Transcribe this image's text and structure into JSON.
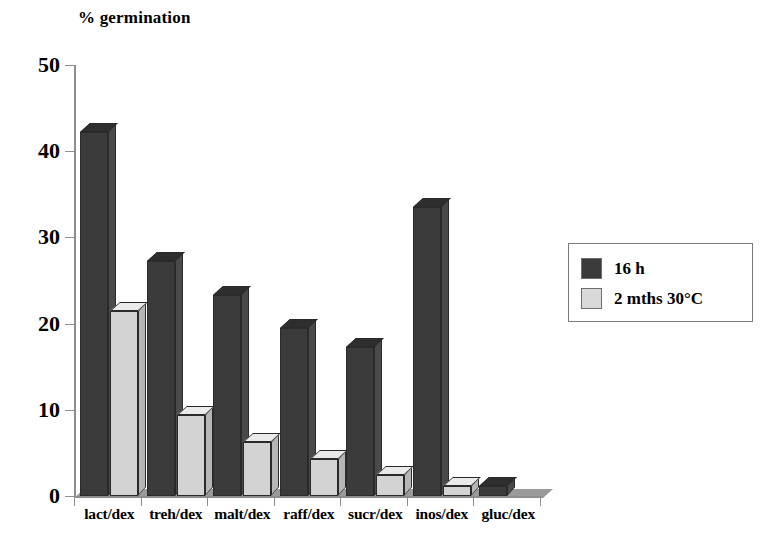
{
  "chart_data": {
    "type": "bar",
    "title": "% germination",
    "xlabel": "",
    "ylabel": "% germination",
    "ylim": [
      0,
      50
    ],
    "yticks": [
      0,
      10,
      20,
      30,
      40,
      50
    ],
    "grid": false,
    "legend_position": "right",
    "categories": [
      "lact/dex",
      "treh/dex",
      "malt/dex",
      "raff/dex",
      "sucr/dex",
      "inos/dex",
      "gluc/dex"
    ],
    "series": [
      {
        "name": "16 h",
        "color": "#3b3b3b",
        "values": [
          42.2,
          27.3,
          23.3,
          19.5,
          17.3,
          33.5,
          1.2
        ]
      },
      {
        "name": "2 mths 30°C",
        "color": "#d3d3d3",
        "values": [
          21.5,
          9.4,
          6.3,
          4.3,
          2.4,
          1.2,
          0.0
        ]
      }
    ]
  },
  "legend": {
    "entries": [
      {
        "label": "16 h",
        "swatch": "dark"
      },
      {
        "label": "2 mths 30°C",
        "swatch": "light"
      }
    ]
  }
}
